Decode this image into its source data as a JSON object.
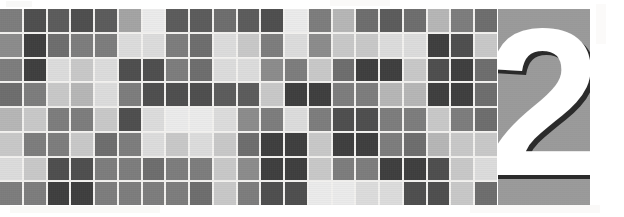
{
  "banner": {
    "kind": "chapter-header-banner",
    "width": 624,
    "height": 217,
    "background_color": "#ffffff"
  },
  "chapter": {
    "number": "2",
    "number_color": "#ffffff",
    "shadow_color": "#2b2b2b",
    "panel_color": "#9b9b9b"
  },
  "mosaic": {
    "columns": 21,
    "rows": 8,
    "gap_color": "#f2f1ef",
    "palette": {
      "d1": "#3f3f3f",
      "d2": "#4f4f4f",
      "d3": "#5c5c5c",
      "m1": "#6e6e6e",
      "m2": "#7d7d7d",
      "m3": "#8c8c8c",
      "l1": "#a4a4a4",
      "l2": "#b6b6b6",
      "l3": "#c8c8c8",
      "l4": "#dcdcdc",
      "l5": "#ebebeb"
    },
    "cells": [
      [
        "m2",
        "d2",
        "d3",
        "d2",
        "d3",
        "l1",
        "l5",
        "d3",
        "d3",
        "m1",
        "d3",
        "d2",
        "l5",
        "m2",
        "l2",
        "m1",
        "d3",
        "m1",
        "l2",
        "m2",
        "m1"
      ],
      [
        "m3",
        "d1",
        "m1",
        "m2",
        "m2",
        "l4",
        "l4",
        "m2",
        "m1",
        "l4",
        "l3",
        "m2",
        "l4",
        "m3",
        "l3",
        "l3",
        "l4",
        "l4",
        "d1",
        "d2",
        "l3"
      ],
      [
        "m2",
        "d1",
        "l4",
        "l3",
        "l4",
        "d2",
        "d2",
        "m2",
        "m1",
        "l4",
        "l4",
        "m3",
        "m2",
        "l3",
        "m1",
        "d1",
        "d1",
        "l3",
        "d2",
        "d1",
        "m1"
      ],
      [
        "m1",
        "m2",
        "l3",
        "l2",
        "l4",
        "m2",
        "d2",
        "d2",
        "d2",
        "d3",
        "d3",
        "l3",
        "d1",
        "d1",
        "m2",
        "m2",
        "l2",
        "l2",
        "d1",
        "d1",
        "m1"
      ],
      [
        "l2",
        "l3",
        "m2",
        "m2",
        "l3",
        "d2",
        "l4",
        "l5",
        "l5",
        "l4",
        "m3",
        "m2",
        "l4",
        "m2",
        "d2",
        "d2",
        "m2",
        "m2",
        "l3",
        "m2",
        "m1"
      ],
      [
        "l3",
        "m2",
        "m2",
        "l3",
        "m1",
        "m2",
        "l4",
        "l3",
        "l4",
        "l3",
        "m1",
        "d1",
        "d1",
        "l3",
        "d1",
        "d1",
        "m2",
        "m1",
        "l2",
        "l3",
        "l3"
      ],
      [
        "l4",
        "l3",
        "d2",
        "d2",
        "m2",
        "m2",
        "m1",
        "m2",
        "m2",
        "l3",
        "m3",
        "d1",
        "d1",
        "l3",
        "m2",
        "m2",
        "d1",
        "d1",
        "d2",
        "l3",
        "l4"
      ],
      [
        "m2",
        "m2",
        "d1",
        "d1",
        "m2",
        "m2",
        "m2",
        "m2",
        "m1",
        "l3",
        "m2",
        "d2",
        "d2",
        "l5",
        "l5",
        "l4",
        "l4",
        "d2",
        "d2",
        "l3",
        "m1"
      ]
    ]
  }
}
